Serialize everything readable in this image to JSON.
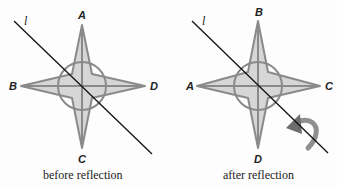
{
  "figure": {
    "line_label": "l",
    "colors": {
      "fill": "#d6d6d6",
      "stroke": "#8a8a8a",
      "line": "#111111",
      "arrow": "#7a7a7a"
    },
    "before": {
      "caption": "before reflection",
      "labels": {
        "top": "A",
        "left": "B",
        "right": "D",
        "bottom": "C"
      }
    },
    "after": {
      "caption": "after reflection",
      "labels": {
        "top": "B",
        "left": "A",
        "right": "C",
        "bottom": "D"
      }
    }
  }
}
